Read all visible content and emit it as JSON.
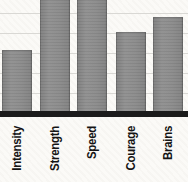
{
  "chart_data": {
    "type": "bar",
    "title": "",
    "xlabel": "",
    "ylabel": "",
    "categories": [
      "Intensity",
      "Strength",
      "Speed",
      "Courage",
      "Brains"
    ],
    "values_px_above_axis": [
      61,
      115,
      115,
      79,
      94
    ],
    "clipped_at_top": [
      false,
      true,
      true,
      false,
      false
    ],
    "approx_values_gridline_units": [
      3.1,
      5.8,
      5.8,
      4.0,
      4.7
    ],
    "grid": "horizontal-only",
    "legend": "none",
    "label_rotation": "90deg counterclockwise",
    "colors": {
      "bar_fill": "#8c8c8c",
      "bar_edge": "#6f6f6f",
      "axis_line": "#1b1b1b",
      "gridline": "#d9d8d4",
      "background": "#fbfaf7",
      "label_text": "#141414"
    }
  }
}
